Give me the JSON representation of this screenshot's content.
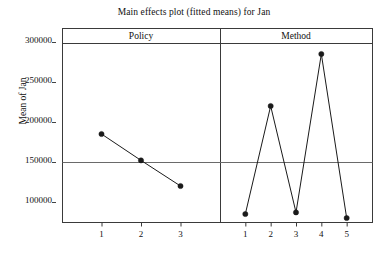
{
  "chart_data": {
    "type": "line",
    "title": "Main effects plot (fitted means) for Jan",
    "xlabel": "",
    "ylabel": "Mean of Jan",
    "ylim": [
      75000,
      305000
    ],
    "yticks": [
      100000,
      150000,
      200000,
      250000,
      300000
    ],
    "ytick_labels": [
      "100000",
      "150000",
      "200000",
      "250000",
      "300000"
    ],
    "grid": false,
    "legend": "none",
    "reference_line": 150000,
    "panels": [
      {
        "name": "Policy",
        "categories": [
          "1",
          "2",
          "3"
        ],
        "values": [
          185000,
          152000,
          120000
        ]
      },
      {
        "name": "Method",
        "categories": [
          "1",
          "2",
          "3",
          "4",
          "5"
        ],
        "values": [
          85000,
          220000,
          87000,
          285000,
          80000
        ]
      }
    ],
    "marker": "filled-circle",
    "line_color": "#1a1a1a",
    "axis_color": "#3a3a3a",
    "reference_line_color": "#6a6a6a"
  }
}
